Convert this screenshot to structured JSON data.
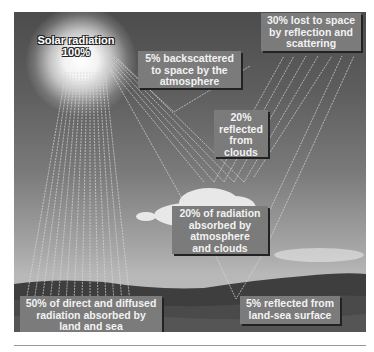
{
  "diagram": {
    "source": {
      "label": "Solar radiation",
      "value": "100%"
    },
    "labels": {
      "backscatter": "5% backscattered to space by the atmosphere",
      "lost": "30% lost to space by reflection and scattering",
      "clouds_reflected": "20% reflected from clouds",
      "absorbed_atmo": "20% of radiation absorbed by atmosphere and clouds",
      "absorbed_surface": "50% of direct and diffused radiation absorbed by land and sea",
      "surface_reflected": "5% reflected from land-sea surface"
    },
    "lines": {
      "backscatter": [
        "5% backscattered",
        "to space by the",
        "atmosphere"
      ],
      "lost": [
        "30% lost to space",
        "by reflection and",
        "scattering"
      ],
      "clouds_reflected": [
        "20%",
        "reflected",
        "from",
        "clouds"
      ],
      "absorbed_atmo": [
        "20% of radiation",
        "absorbed by",
        "atmosphere",
        "and clouds"
      ],
      "absorbed_surface": [
        "50% of direct and diffused",
        "radiation absorbed by",
        "land and sea"
      ],
      "surface_reflected": [
        "5% reflected from",
        "land-sea surface"
      ]
    },
    "colors": {
      "sky_top": "#4c4c4c",
      "sky_horizon": "#b8b8b8",
      "label_bg": "#7b7b7b",
      "label_text": "#f2f2f2",
      "ground": "#3a3a3a"
    }
  }
}
